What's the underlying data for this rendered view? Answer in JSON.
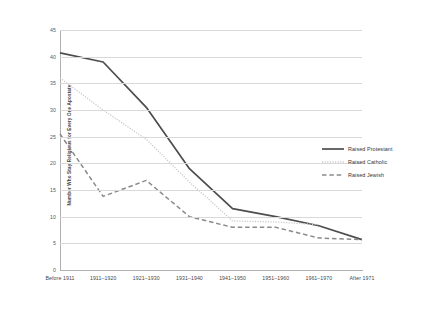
{
  "chart_data": {
    "type": "line",
    "title": "",
    "xlabel": "",
    "ylabel": "Number Who Stay Religious for Every One Apostate",
    "ylim": [
      0,
      45
    ],
    "ytick_step": 5,
    "yticks": [
      "0",
      "5",
      "10",
      "15",
      "20",
      "25",
      "30",
      "35",
      "40",
      "45"
    ],
    "grid": "horizontal",
    "legend_position": "right",
    "categories": [
      "Before 1911",
      "1911–1920",
      "1921–1930",
      "1931–1940",
      "1941–1950",
      "1951–1960",
      "1961–1970",
      "After 1971"
    ],
    "series": [
      {
        "name": "Raised Protestant",
        "style": "solid",
        "color": "#4d4d4d",
        "values": [
          40.7,
          39.0,
          30.5,
          19.0,
          11.5,
          10.0,
          8.3,
          5.7
        ]
      },
      {
        "name": "Raised Catholic",
        "style": "dotted",
        "color": "#c8c8c8",
        "values": [
          36.0,
          30.0,
          24.5,
          16.5,
          9.2,
          9.0,
          8.5,
          null
        ]
      },
      {
        "name": "Raised Jewish",
        "style": "dashed",
        "color": "#8a8a8a",
        "values": [
          25.5,
          13.8,
          16.8,
          10.0,
          8.0,
          8.0,
          6.0,
          5.7
        ]
      }
    ]
  },
  "legend": {
    "items": [
      {
        "label": "Raised Protestant"
      },
      {
        "label": "Raised Catholic"
      },
      {
        "label": "Raised Jewish"
      }
    ]
  },
  "axis": {
    "y_title": "Number Who Stay Religious for Every One Apostate"
  }
}
